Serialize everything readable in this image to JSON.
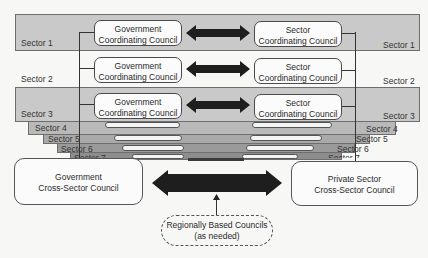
{
  "sectors": [
    {
      "id": 1,
      "label": "Sector 1",
      "shade": "#c9c9c9"
    },
    {
      "id": 2,
      "label": "Sector 2",
      "shade": "#f7f7f5"
    },
    {
      "id": 3,
      "label": "Sector 3",
      "shade": "#c9c9c9"
    },
    {
      "id": 4,
      "label": "Sector 4",
      "shade": "#b9b9b9"
    },
    {
      "id": 5,
      "label": "Sector 5",
      "shade": "#a9a9a9"
    },
    {
      "id": 6,
      "label": "Sector 6",
      "shade": "#9a9a9a"
    },
    {
      "id": 7,
      "label": "Sector 7",
      "shade": "#8d8d8d"
    }
  ],
  "government_council": {
    "line1": "Government",
    "line2": "Coordinating Council"
  },
  "sector_council": {
    "line1": "Sector",
    "line2": "Coordinating Council"
  },
  "gov_cross_sector": {
    "line1": "Government",
    "line2": "Cross-Sector Council"
  },
  "private_cross_sector": {
    "line1": "Private Sector",
    "line2": "Cross-Sector Council"
  },
  "regional": {
    "line1": "Regionally Based Councils",
    "line2": "(as needed)"
  },
  "colors": {
    "arrow": "#1e1e1e",
    "band_gray": "#c9c9c9",
    "border": "#4a4a4a"
  }
}
